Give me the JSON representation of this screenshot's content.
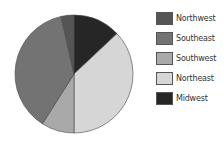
{
  "chart_data": {
    "type": "pie",
    "title": "",
    "start_angle": "12 o'clock, clockwise",
    "slices": [
      {
        "name": "Midwest",
        "value": 13,
        "color": "#262626"
      },
      {
        "name": "Northeast",
        "value": 37,
        "color": "#d6d6d6"
      },
      {
        "name": "Southwest",
        "value": 9,
        "color": "#a9a9a9"
      },
      {
        "name": "Southeast",
        "value": 37.5,
        "color": "#737373"
      },
      {
        "name": "Northwest",
        "value": 3.5,
        "color": "#555555"
      }
    ],
    "legend_position": "right",
    "legend_order": [
      "Northwest",
      "Southeast",
      "Southwest",
      "Northeast",
      "Midwest"
    ]
  },
  "legend": {
    "items": [
      {
        "label": "Northwest",
        "color": "#555555"
      },
      {
        "label": "Southeast",
        "color": "#737373"
      },
      {
        "label": "Southwest",
        "color": "#a9a9a9"
      },
      {
        "label": "Northeast",
        "color": "#d6d6d6"
      },
      {
        "label": "Midwest",
        "color": "#262626"
      }
    ]
  }
}
